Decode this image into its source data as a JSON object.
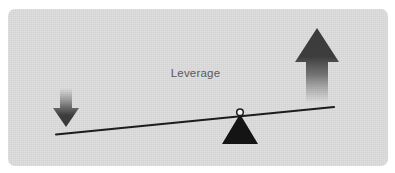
{
  "diagram": {
    "title": "Leverage",
    "type": "lever-seesaw-illustration",
    "label": {
      "text": "Leverage",
      "color": "#5a5a5a",
      "center_x": 196,
      "baseline_y": 78
    },
    "card": {
      "background_color": "#dcdcdc",
      "border_radius": 7,
      "x": 8,
      "y": 9,
      "width": 380,
      "height": 157
    },
    "page_background_color": "#ffffff",
    "elements": {
      "beam": {
        "name": "lever-beam",
        "color": "#1a1a1a",
        "stroke_width": 2,
        "x1": 56,
        "y1": 134,
        "x2": 334,
        "y2": 107
      },
      "fulcrum": {
        "name": "fulcrum-triangle",
        "color": "#111111",
        "apex_x": 240,
        "apex_y": 114,
        "base_left_x": 222,
        "base_right_x": 258,
        "base_y": 144
      },
      "pivot": {
        "name": "pivot-circle",
        "fill": "#ffffff",
        "stroke": "#111111",
        "cx": 240,
        "cy": 112,
        "r": 3.2
      },
      "arrow_up": {
        "name": "arrow-up",
        "direction": "up",
        "color_dark": "#3d3d3d",
        "color_fade": "rgba(61,61,61,0)",
        "head_apex_x": 317,
        "head_apex_y": 28,
        "head_left_x": 295,
        "head_right_x": 339,
        "head_base_y": 62,
        "shaft_left_x": 306,
        "shaft_right_x": 328,
        "shaft_top_y": 62,
        "shaft_bottom_y": 103
      },
      "arrow_down": {
        "name": "arrow-down",
        "direction": "down",
        "color_dark": "#3d3d3d",
        "color_fade": "rgba(61,61,61,0)",
        "head_apex_x": 66,
        "head_apex_y": 127,
        "head_left_x": 53,
        "head_right_x": 79,
        "head_base_y": 108,
        "shaft_left_x": 60,
        "shaft_right_x": 72,
        "shaft_top_y": 88,
        "shaft_bottom_y": 108
      }
    }
  }
}
